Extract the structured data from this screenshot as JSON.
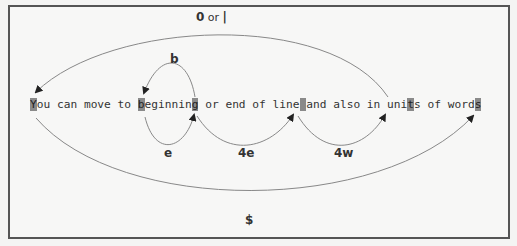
{
  "diagram": {
    "sentence": "You can move to beginning or end of line and also in units of words",
    "highlighted_indices": [
      0,
      16,
      24,
      40,
      56,
      66
    ],
    "highlight_color": "#8a8a8a",
    "line_color": "#888888",
    "arrows": [
      {
        "id": "zero-or-pipe",
        "label_key": "0",
        "label_sep": " or ",
        "label_key2": "|",
        "from_char": 56,
        "to_char": 0,
        "side": "above"
      },
      {
        "id": "b",
        "label": "b",
        "from_char": 24,
        "to_char": 16,
        "side": "above"
      },
      {
        "id": "e",
        "label": "e",
        "from_char": 16,
        "to_char": 24,
        "side": "below"
      },
      {
        "id": "4e",
        "label": "4e",
        "from_char": 24,
        "to_char": 40,
        "side": "below"
      },
      {
        "id": "4w",
        "label": "4w",
        "from_char": 40,
        "to_char": 56,
        "side": "below"
      },
      {
        "id": "dollar",
        "label": "$",
        "from_char": 0,
        "to_char": 66,
        "side": "below"
      }
    ]
  }
}
